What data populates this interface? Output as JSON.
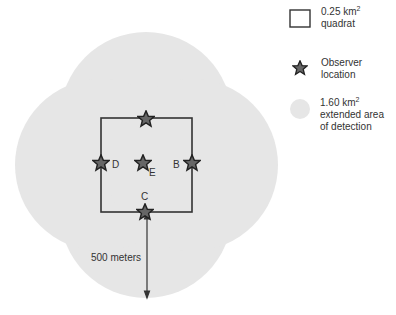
{
  "diagram": {
    "observers": [
      {
        "id": "A",
        "label": ""
      },
      {
        "id": "B",
        "label": "B"
      },
      {
        "id": "C",
        "label": "C"
      },
      {
        "id": "D",
        "label": "D"
      },
      {
        "id": "E",
        "label": "E"
      }
    ],
    "distance_label": "500 meters"
  },
  "legend": {
    "quadrat": {
      "line1_prefix": "0.25 km",
      "sup": "2",
      "line2": "quadrat"
    },
    "observer": {
      "line1": "Observer",
      "line2": "location"
    },
    "area": {
      "line1_prefix": "1.60 km",
      "sup": "2",
      "line2": "extended area",
      "line3": "of detection"
    }
  },
  "colors": {
    "area": "#e6e6e6",
    "lines": "#333333",
    "star": "#555555"
  }
}
